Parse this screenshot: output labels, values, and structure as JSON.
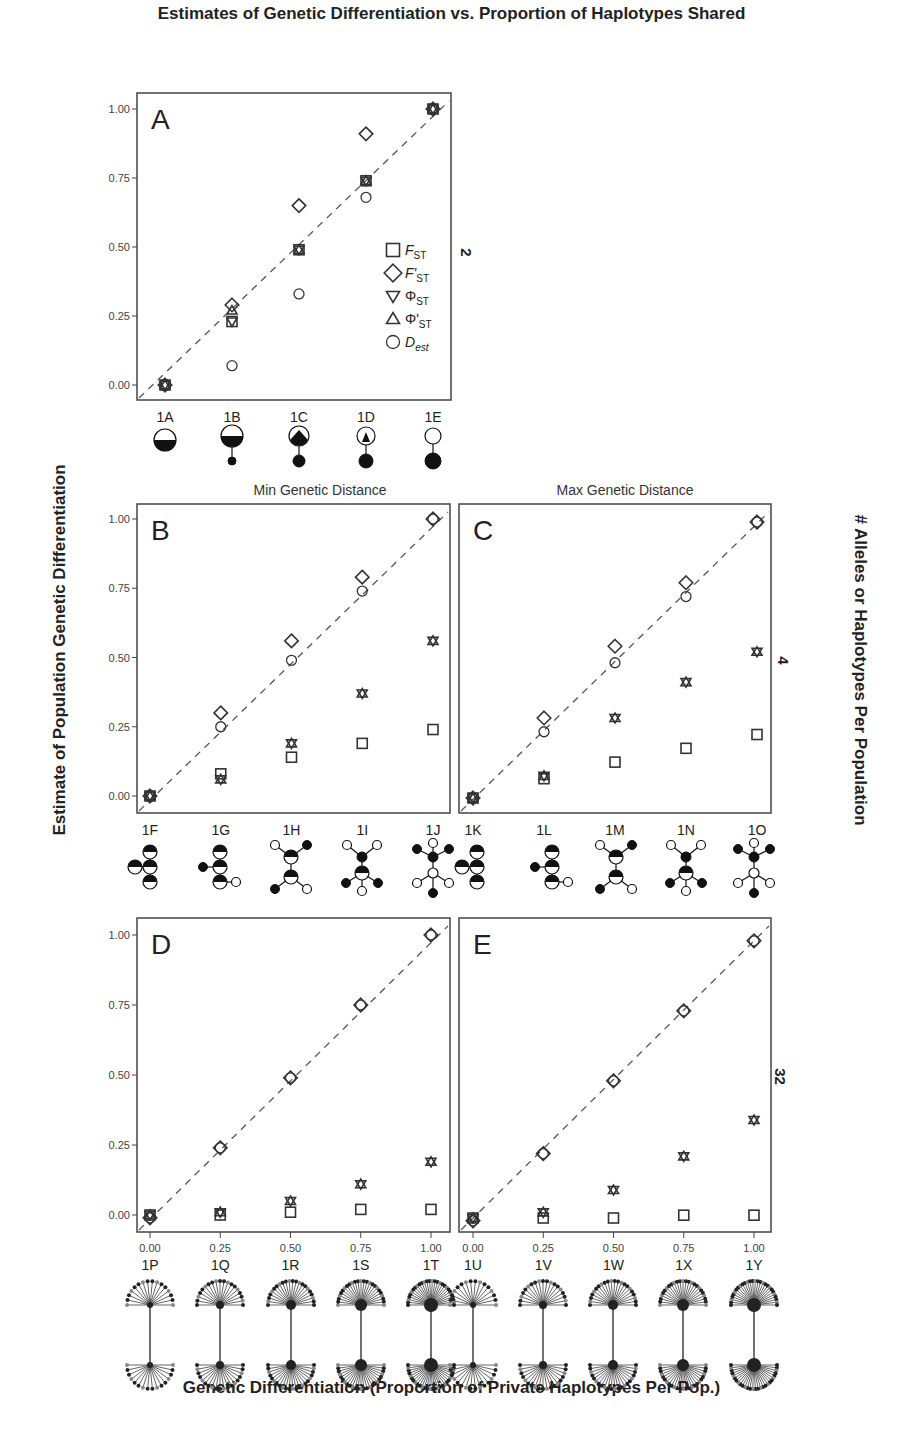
{
  "title": "Estimates of Genetic Differentiation vs. Proportion of Haplotypes Shared",
  "ylabel": "Estimate of Population Genetic Differentiation",
  "xlabel": "Genetic Differentiation (Proportion of Private Haplotypes Per Pop.)",
  "right_label": "# Alleles or Haplotypes Per Population",
  "row_labels": [
    "2",
    "4",
    "32"
  ],
  "column_titles": [
    "Min Genetic Distance",
    "Max Genetic Distance"
  ],
  "legend": [
    {
      "symbol": "square",
      "label": "F",
      "sub": "ST"
    },
    {
      "symbol": "diamond",
      "label": "F'",
      "sub": "ST"
    },
    {
      "symbol": "triangle-down",
      "label": "Φ",
      "sub": "ST"
    },
    {
      "symbol": "triangle-up",
      "label": "Φ'",
      "sub": "ST"
    },
    {
      "symbol": "circle",
      "label": "D",
      "sub": "est"
    }
  ],
  "y_ticks": [
    "0.00",
    "0.25",
    "0.50",
    "0.75",
    "1.00"
  ],
  "x_ticks": [
    "0.00",
    "0.25",
    "0.50",
    "0.75",
    "1.00"
  ],
  "chart_data": [
    {
      "panel": "A",
      "type": "scatter",
      "alleles_per_pop": 2,
      "categories": [
        "1A",
        "1B",
        "1C",
        "1D",
        "1E"
      ],
      "x": [
        0,
        0.25,
        0.5,
        0.75,
        1.0
      ],
      "ylim": [
        0,
        1
      ],
      "series": [
        {
          "name": "F_ST",
          "values": [
            0.0,
            0.23,
            0.49,
            0.74,
            1.0
          ]
        },
        {
          "name": "F'_ST",
          "values": [
            0.0,
            0.29,
            0.65,
            0.91,
            1.0
          ]
        },
        {
          "name": "Phi_ST",
          "values": [
            0.0,
            0.23,
            0.49,
            0.74,
            1.0
          ]
        },
        {
          "name": "Phi'_ST",
          "values": [
            0.0,
            0.27,
            0.49,
            0.74,
            1.0
          ]
        },
        {
          "name": "D_est",
          "values": [
            0.0,
            0.07,
            0.33,
            0.68,
            1.0
          ]
        }
      ],
      "reference_line": "y = x (dashed)"
    },
    {
      "panel": "B",
      "type": "scatter",
      "alleles_per_pop": 4,
      "subtitle": "Min Genetic Distance",
      "categories": [
        "1F",
        "1G",
        "1H",
        "1I",
        "1J"
      ],
      "x": [
        0,
        0.25,
        0.5,
        0.75,
        1.0
      ],
      "ylim": [
        0,
        1
      ],
      "series": [
        {
          "name": "F_ST",
          "values": [
            0.0,
            0.08,
            0.14,
            0.19,
            0.24
          ]
        },
        {
          "name": "F'_ST",
          "values": [
            0.0,
            0.3,
            0.56,
            0.79,
            1.0
          ]
        },
        {
          "name": "Phi_ST",
          "values": [
            0.0,
            0.06,
            0.19,
            0.37,
            0.56
          ]
        },
        {
          "name": "Phi'_ST",
          "values": [
            0.0,
            0.06,
            0.19,
            0.37,
            0.56
          ]
        },
        {
          "name": "D_est",
          "values": [
            0.0,
            0.25,
            0.49,
            0.74,
            1.0
          ]
        }
      ]
    },
    {
      "panel": "C",
      "type": "scatter",
      "alleles_per_pop": 4,
      "subtitle": "Max Genetic Distance",
      "categories": [
        "1K",
        "1L",
        "1M",
        "1N",
        "1O"
      ],
      "x": [
        0,
        0.25,
        0.5,
        0.75,
        1.0
      ],
      "ylim": [
        0,
        1
      ],
      "series": [
        {
          "name": "F_ST",
          "values": [
            0.0,
            0.07,
            0.13,
            0.18,
            0.23
          ]
        },
        {
          "name": "F'_ST",
          "values": [
            0.0,
            0.29,
            0.55,
            0.78,
            1.0
          ]
        },
        {
          "name": "Phi_ST",
          "values": [
            0.0,
            0.08,
            0.29,
            0.42,
            0.53
          ]
        },
        {
          "name": "Phi'_ST",
          "values": [
            0.0,
            0.08,
            0.29,
            0.42,
            0.53
          ]
        },
        {
          "name": "D_est",
          "values": [
            0.0,
            0.24,
            0.49,
            0.73,
            1.0
          ]
        }
      ]
    },
    {
      "panel": "D",
      "type": "scatter",
      "alleles_per_pop": 32,
      "categories": [
        "1P",
        "1Q",
        "1R",
        "1S",
        "1T"
      ],
      "x": [
        0,
        0.25,
        0.5,
        0.75,
        1.0
      ],
      "ylim": [
        0,
        1
      ],
      "series": [
        {
          "name": "F_ST",
          "values": [
            0.0,
            0.0,
            0.01,
            0.02,
            0.02
          ]
        },
        {
          "name": "F'_ST",
          "values": [
            -0.01,
            0.24,
            0.49,
            0.75,
            1.0
          ]
        },
        {
          "name": "Phi_ST",
          "values": [
            0.0,
            0.01,
            0.05,
            0.11,
            0.19
          ]
        },
        {
          "name": "Phi'_ST",
          "values": [
            0.0,
            0.01,
            0.05,
            0.11,
            0.19
          ]
        },
        {
          "name": "D_est",
          "values": [
            -0.01,
            0.24,
            0.49,
            0.75,
            1.0
          ]
        }
      ]
    },
    {
      "panel": "E",
      "type": "scatter",
      "alleles_per_pop": 32,
      "categories": [
        "1U",
        "1V",
        "1W",
        "1X",
        "1Y"
      ],
      "x": [
        0,
        0.25,
        0.5,
        0.75,
        1.0
      ],
      "ylim": [
        0,
        1
      ],
      "xlabel": "Genetic Differentiation (Proportion of Private Haplotypes Per Pop.)",
      "series": [
        {
          "name": "F_ST",
          "values": [
            0.0,
            0.0,
            0.0,
            0.01,
            0.01
          ]
        },
        {
          "name": "F'_ST",
          "values": [
            -0.01,
            0.23,
            0.49,
            0.74,
            0.99
          ]
        },
        {
          "name": "Phi_ST",
          "values": [
            0.0,
            0.02,
            0.1,
            0.22,
            0.35
          ]
        },
        {
          "name": "Phi'_ST",
          "values": [
            0.0,
            0.02,
            0.1,
            0.22,
            0.35
          ]
        },
        {
          "name": "D_est",
          "values": [
            -0.01,
            0.23,
            0.49,
            0.74,
            0.99
          ]
        }
      ]
    }
  ]
}
